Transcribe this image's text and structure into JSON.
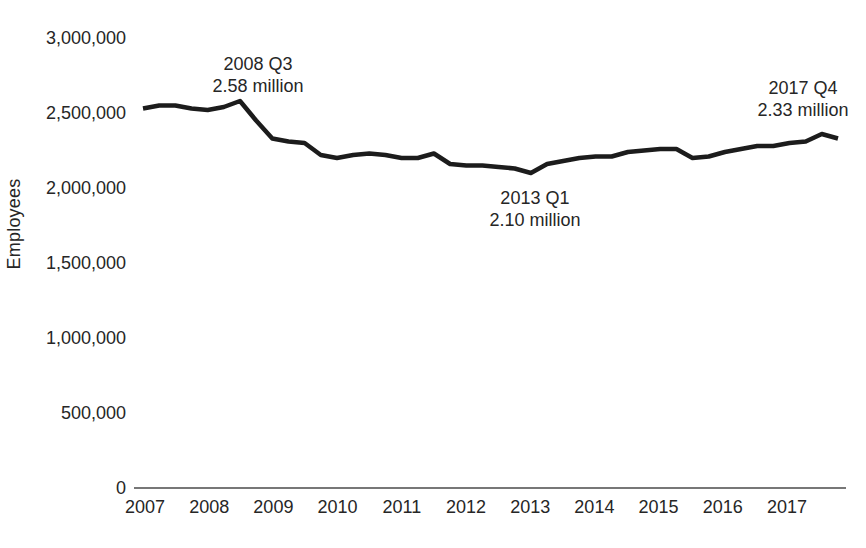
{
  "figure": {
    "background_color": "#ffffff",
    "text_color": "#262626",
    "line_color": "#1c1c1c",
    "axis_color": "#4a4a4a"
  },
  "chart_data": {
    "type": "line",
    "title": "",
    "xlabel": "",
    "ylabel": "Employees",
    "grid": false,
    "legend": null,
    "ylim": [
      0,
      3000000
    ],
    "y_ticks": [
      {
        "label": "0",
        "value": 0
      },
      {
        "label": "500,000",
        "value": 500000
      },
      {
        "label": "1,000,000",
        "value": 1000000
      },
      {
        "label": "1,500,000",
        "value": 1500000
      },
      {
        "label": "2,000,000",
        "value": 2000000
      },
      {
        "label": "2,500,000",
        "value": 2500000
      },
      {
        "label": "3,000,000",
        "value": 3000000
      }
    ],
    "x_tick_labels": [
      "2007",
      "2008",
      "2009",
      "2010",
      "2011",
      "2012",
      "2013",
      "2014",
      "2015",
      "2016",
      "2017"
    ],
    "x": [
      "2007 Q1",
      "2007 Q2",
      "2007 Q3",
      "2007 Q4",
      "2008 Q1",
      "2008 Q2",
      "2008 Q3",
      "2008 Q4",
      "2009 Q1",
      "2009 Q2",
      "2009 Q3",
      "2009 Q4",
      "2010 Q1",
      "2010 Q2",
      "2010 Q3",
      "2010 Q4",
      "2011 Q1",
      "2011 Q2",
      "2011 Q3",
      "2011 Q4",
      "2012 Q1",
      "2012 Q2",
      "2012 Q3",
      "2012 Q4",
      "2013 Q1",
      "2013 Q2",
      "2013 Q3",
      "2013 Q4",
      "2014 Q1",
      "2014 Q2",
      "2014 Q3",
      "2014 Q4",
      "2015 Q1",
      "2015 Q2",
      "2015 Q3",
      "2015 Q4",
      "2016 Q1",
      "2016 Q2",
      "2016 Q3",
      "2016 Q4",
      "2017 Q1",
      "2017 Q2",
      "2017 Q3",
      "2017 Q4"
    ],
    "series": [
      {
        "name": "Employees",
        "values": [
          2530000,
          2550000,
          2550000,
          2530000,
          2520000,
          2540000,
          2580000,
          2450000,
          2330000,
          2310000,
          2300000,
          2220000,
          2200000,
          2220000,
          2230000,
          2220000,
          2200000,
          2200000,
          2230000,
          2160000,
          2150000,
          2150000,
          2140000,
          2130000,
          2100000,
          2160000,
          2180000,
          2200000,
          2210000,
          2210000,
          2240000,
          2250000,
          2260000,
          2260000,
          2200000,
          2210000,
          2240000,
          2260000,
          2280000,
          2280000,
          2300000,
          2310000,
          2360000,
          2330000
        ]
      }
    ],
    "annotations": [
      {
        "quarter": "2008 Q3",
        "value_text": "2.58 million",
        "value": 2580000,
        "position": "above"
      },
      {
        "quarter": "2013 Q1",
        "value_text": "2.10 million",
        "value": 2100000,
        "position": "below"
      },
      {
        "quarter": "2017 Q4",
        "value_text": "2.33 million",
        "value": 2330000,
        "position": "above"
      }
    ]
  }
}
